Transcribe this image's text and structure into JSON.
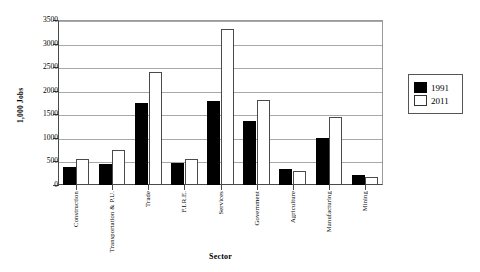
{
  "chart_data": {
    "type": "bar",
    "title": "",
    "xlabel": "Sector",
    "ylabel": "1,000 Jobs",
    "ylim": [
      0,
      3500
    ],
    "ytick_step": 500,
    "yticks": [
      "0",
      "500",
      "1000",
      "1500",
      "2000",
      "2500",
      "3000",
      "3500"
    ],
    "grid": true,
    "legend_position": "right",
    "categories": [
      "Construction",
      "Transportation & P.U.",
      "Trade",
      "F.I.R.E.",
      "Services",
      "Government",
      "Agriculture",
      "Manufacturing",
      "Mining"
    ],
    "series": [
      {
        "name": "1991",
        "color": "#000000",
        "values": [
          380,
          450,
          1750,
          460,
          1780,
          1350,
          330,
          1000,
          210
        ]
      },
      {
        "name": "2011",
        "color": "#ffffff",
        "values": [
          560,
          750,
          2400,
          550,
          3320,
          1800,
          300,
          1450,
          180
        ]
      }
    ]
  },
  "legend": {
    "entries": [
      {
        "label": "1991"
      },
      {
        "label": "2011"
      }
    ]
  },
  "colors": {
    "series_a": "#000000",
    "series_b": "#ffffff",
    "axis": "#4a4a4a",
    "grid": "#a8a8a8",
    "background": "#ffffff"
  }
}
